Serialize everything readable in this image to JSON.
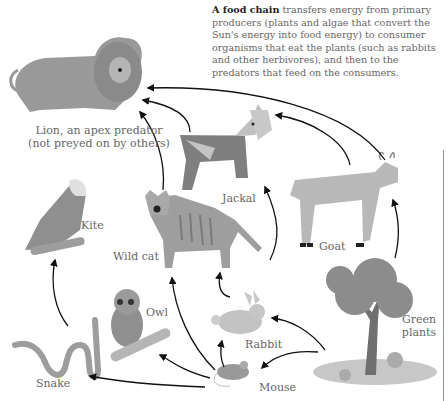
{
  "intro": {
    "bold": "A food chain",
    "text": " transfers energy from primary producers (plants and algae that convert the Sun's energy into food energy) to consumer organisms that eat the plants (such as rabbits and other herbivores), and then to the predators that feed on the consumers."
  },
  "labels": {
    "lion": "Lion, an apex predator (not preyed on by others)",
    "jackal": "Jackal",
    "goat": "Goat",
    "kite": "Kite",
    "wildcat": "Wild cat",
    "owl": "Owl",
    "rabbit": "Rabbit",
    "green_plants": "Green plants",
    "snake": "Snake",
    "mouse": "Mouse"
  },
  "links": [
    {
      "from": "Goat",
      "to": "Lion"
    },
    {
      "from": "Goat",
      "to": "Jackal"
    },
    {
      "from": "Jackal",
      "to": "Lion"
    },
    {
      "from": "Wild cat",
      "to": "Lion"
    },
    {
      "from": "Rabbit",
      "to": "Jackal"
    },
    {
      "from": "Rabbit",
      "to": "Wild cat"
    },
    {
      "from": "Mouse",
      "to": "Rabbit-area/Jackal"
    },
    {
      "from": "Mouse",
      "to": "Wild cat"
    },
    {
      "from": "Mouse",
      "to": "Owl"
    },
    {
      "from": "Mouse",
      "to": "Snake"
    },
    {
      "from": "Snake",
      "to": "Kite"
    },
    {
      "from": "Green plants",
      "to": "Goat"
    },
    {
      "from": "Green plants",
      "to": "Rabbit"
    },
    {
      "from": "Green plants",
      "to": "Mouse"
    }
  ],
  "colors": {
    "arrow": "#111111",
    "animal_dark": "#7a7a7a",
    "animal_mid": "#9a9a9a",
    "animal_light": "#c4c4c4",
    "text": "#666666"
  }
}
